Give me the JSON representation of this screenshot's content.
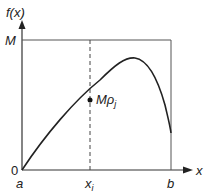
{
  "diagram": {
    "y_axis_label": "f(x)",
    "x_axis_label": "x",
    "max_label": "M",
    "origin_label": "0",
    "a_label": "a",
    "b_label": "b",
    "xi_label": "x",
    "xi_sub": "i",
    "point_label": "Mρ",
    "point_sub": "j",
    "colors": {
      "line": "#333333",
      "dashed": "#333333",
      "background": "#ffffff"
    }
  }
}
